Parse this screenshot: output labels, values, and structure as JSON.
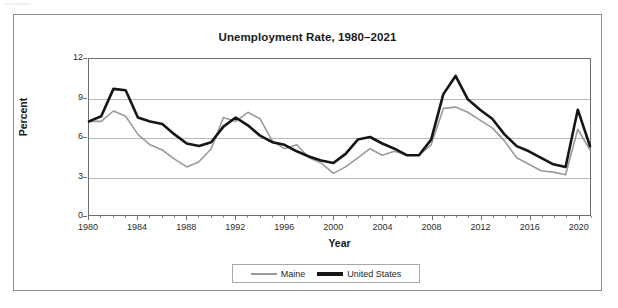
{
  "page": {
    "scrap_top": "not available.",
    "scrap_bottom": ""
  },
  "legend": {
    "maine_label": "Maine",
    "us_label": "United States"
  },
  "chart_data": {
    "type": "line",
    "title": "Unemployment Rate, 1980–2021",
    "xlabel": "Year",
    "ylabel": "Percent",
    "ylim": [
      0,
      12
    ],
    "xlim": [
      1980,
      2021
    ],
    "yticks": [
      0,
      3,
      6,
      9,
      12
    ],
    "xticks": [
      1980,
      1984,
      1988,
      1992,
      1996,
      2000,
      2004,
      2008,
      2012,
      2016,
      2020
    ],
    "grid": true,
    "legend_position": "bottom-center",
    "colors": {
      "maine": "#9a9a9a",
      "united_states": "#151515"
    },
    "x": [
      1980,
      1981,
      1982,
      1983,
      1984,
      1985,
      1986,
      1987,
      1988,
      1989,
      1990,
      1991,
      1992,
      1993,
      1994,
      1995,
      1996,
      1997,
      1998,
      1999,
      2000,
      2001,
      2002,
      2003,
      2004,
      2005,
      2006,
      2007,
      2008,
      2009,
      2010,
      2011,
      2012,
      2013,
      2014,
      2015,
      2016,
      2017,
      2018,
      2019,
      2020,
      2021
    ],
    "series": [
      {
        "name": "Maine",
        "values": [
          7.2,
          7.2,
          8.0,
          7.6,
          6.2,
          5.4,
          5.0,
          4.3,
          3.7,
          4.1,
          5.1,
          7.5,
          7.2,
          7.9,
          7.4,
          5.7,
          5.1,
          5.4,
          4.4,
          4.0,
          3.2,
          3.7,
          4.4,
          5.1,
          4.6,
          4.9,
          4.6,
          4.6,
          5.4,
          8.2,
          8.3,
          7.9,
          7.3,
          6.7,
          5.7,
          4.4,
          3.9,
          3.4,
          3.3,
          3.1,
          6.6,
          5.0
        ]
      },
      {
        "name": "United States",
        "values": [
          7.2,
          7.6,
          9.7,
          9.6,
          7.5,
          7.2,
          7.0,
          6.2,
          5.5,
          5.3,
          5.6,
          6.8,
          7.5,
          6.9,
          6.1,
          5.6,
          5.4,
          4.9,
          4.5,
          4.2,
          4.0,
          4.7,
          5.8,
          6.0,
          5.5,
          5.1,
          4.6,
          4.6,
          5.8,
          9.3,
          10.7,
          8.9,
          8.1,
          7.4,
          6.2,
          5.3,
          4.9,
          4.4,
          3.9,
          3.7,
          8.1,
          5.3
        ]
      }
    ]
  }
}
